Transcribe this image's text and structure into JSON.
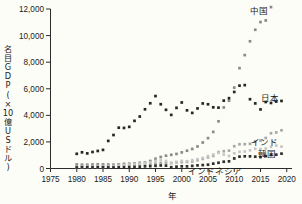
{
  "chart_data": {
    "type": "scatter",
    "title": "",
    "xlabel": "年",
    "ylabel": "名目GDP(×10億USドル)",
    "ylabel_chars": [
      "名",
      "目",
      "G",
      "D",
      "P",
      "(",
      "×",
      "10",
      "億",
      "U",
      "S",
      "ド",
      "ル",
      ")"
    ],
    "xlim": [
      1975,
      2021
    ],
    "ylim": [
      0,
      12000
    ],
    "ytick_labels": [
      "12,000",
      "10,000",
      "8,000",
      "6,000",
      "4,000",
      "2,000",
      "0"
    ],
    "ytick_values": [
      12000,
      10000,
      8000,
      6000,
      4000,
      2000,
      0
    ],
    "xtick_labels": [
      "1975",
      "1980",
      "1985",
      "1990",
      "1995",
      "2000",
      "2005",
      "2010",
      "2015",
      "2020"
    ],
    "xtick_values": [
      1975,
      1980,
      1985,
      1990,
      1995,
      2000,
      2005,
      2010,
      2015,
      2020
    ],
    "grid": false,
    "legend_position": "inline-right",
    "x": [
      1980,
      1981,
      1982,
      1983,
      1984,
      1985,
      1986,
      1987,
      1988,
      1989,
      1990,
      1991,
      1992,
      1993,
      1994,
      1995,
      1996,
      1997,
      1998,
      1999,
      2000,
      2001,
      2002,
      2003,
      2004,
      2005,
      2006,
      2007,
      2008,
      2009,
      2010,
      2011,
      2012,
      2013,
      2014,
      2015,
      2016,
      2017,
      2018,
      2019
    ],
    "series": [
      {
        "name": "中国",
        "color": "#8a8a8a",
        "values": [
          303,
          289,
          284,
          305,
          314,
          309,
          301,
          273,
          312,
          348,
          361,
          383,
          427,
          445,
          564,
          734,
          863,
          962,
          1029,
          1094,
          1211,
          1339,
          1470,
          1660,
          1955,
          2286,
          2752,
          3550,
          4594,
          5102,
          6087,
          7552,
          8532,
          9570,
          10438,
          11016,
          11138,
          12143,
          13608,
          14280
        ]
      },
      {
        "name": "日本",
        "color": "#262626",
        "values": [
          1105,
          1218,
          1135,
          1243,
          1318,
          1399,
          2076,
          2520,
          3072,
          3054,
          3133,
          3585,
          3909,
          4455,
          4907,
          5449,
          4834,
          4415,
          4032,
          4562,
          4968,
          4375,
          4182,
          4519,
          4893,
          4831,
          4602,
          4579,
          5106,
          5289,
          5759,
          6233,
          6272,
          5212,
          4897,
          4444,
          5003,
          4930,
          5037,
          5082
        ]
      },
      {
        "name": "インド",
        "color": "#a8a8a8",
        "values": [
          189,
          196,
          201,
          218,
          212,
          232,
          250,
          280,
          297,
          296,
          321,
          274,
          293,
          284,
          334,
          366,
          400,
          416,
          421,
          459,
          477,
          494,
          524,
          618,
          721,
          834,
          949,
          1239,
          1299,
          1342,
          1676,
          1823,
          1828,
          1857,
          2039,
          2104,
          2295,
          2652,
          2713,
          2875
        ]
      },
      {
        "name": "韓国",
        "color": "#c6c6c6",
        "values": [
          65,
          72,
          78,
          87,
          95,
          101,
          115,
          146,
          199,
          243,
          283,
          329,
          355,
          392,
          461,
          566,
          610,
          569,
          383,
          497,
          576,
          548,
          627,
          702,
          793,
          935,
          1053,
          1173,
          1047,
          944,
          1144,
          1253,
          1278,
          1371,
          1484,
          1466,
          1500,
          1623,
          1725,
          1647
        ]
      },
      {
        "name": "インドネシア",
        "color": "#2e2e2e",
        "values": [
          72,
          85,
          86,
          82,
          85,
          86,
          80,
          76,
          84,
          94,
          106,
          116,
          128,
          159,
          177,
          202,
          227,
          215,
          95,
          140,
          165,
          160,
          196,
          235,
          257,
          286,
          365,
          432,
          511,
          539,
          755,
          893,
          918,
          913,
          891,
          861,
          932,
          1016,
          1042,
          1119
        ]
      }
    ],
    "series_label_positions": [
      {
        "name": "中国",
        "x": 268,
        "y": 14
      },
      {
        "name": "日本",
        "x": 279,
        "y": 101
      },
      {
        "name": "インド",
        "x": 278,
        "y": 145
      },
      {
        "name": "韓国",
        "x": 276,
        "y": 157
      },
      {
        "name": "インドネシア",
        "x": 242,
        "y": 174
      }
    ]
  }
}
